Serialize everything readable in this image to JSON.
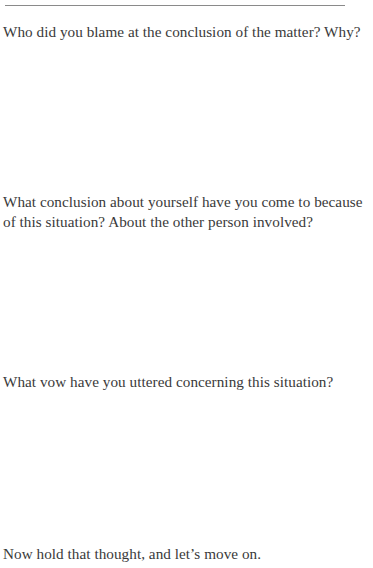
{
  "page": {
    "header_fragment": {
      "left": "",
      "right": ""
    },
    "questions": [
      {
        "lines": [
          "Who did you blame at the conclusion of the matter? Why?"
        ]
      },
      {
        "lines": [
          "What conclusion about yourself have you come to because",
          "of this situation? About the other person involved?"
        ]
      },
      {
        "lines": [
          "What vow have you uttered concerning this situation?"
        ]
      }
    ],
    "closing_line": "Now hold that thought, and let’s move on."
  }
}
